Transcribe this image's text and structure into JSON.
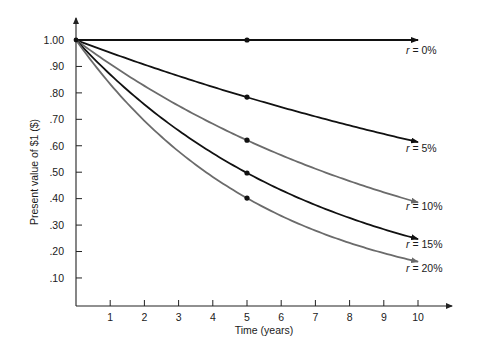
{
  "chart_data": {
    "type": "line",
    "title": "",
    "xlabel": "Time (years)",
    "ylabel": "Present value of $1 ($)",
    "xlim": [
      0,
      10
    ],
    "ylim": [
      0,
      1.0
    ],
    "x_ticks": [
      "1",
      "2",
      "3",
      "4",
      "5",
      "6",
      "7",
      "8",
      "9",
      "10"
    ],
    "y_ticks": [
      "1.00",
      ".90",
      ".80",
      ".70",
      ".60",
      ".50",
      ".40",
      ".30",
      ".20",
      ".10"
    ],
    "grid": false,
    "legend_position": "inline-right",
    "x": [
      0,
      1,
      2,
      3,
      4,
      5,
      6,
      7,
      8,
      9,
      10
    ],
    "series": [
      {
        "name": "r = 0%",
        "rate": 0.0,
        "color": "#111111",
        "values": [
          1.0,
          1.0,
          1.0,
          1.0,
          1.0,
          1.0,
          1.0,
          1.0,
          1.0,
          1.0,
          1.0
        ],
        "marker_at_5": 1.0
      },
      {
        "name": "r = 5%",
        "rate": 0.05,
        "color": "#111111",
        "values": [
          1.0,
          0.952,
          0.907,
          0.864,
          0.823,
          0.784,
          0.746,
          0.711,
          0.677,
          0.645,
          0.614
        ],
        "marker_at_5": 0.784
      },
      {
        "name": "r = 10%",
        "rate": 0.1,
        "color": "#6b6b6b",
        "values": [
          1.0,
          0.909,
          0.826,
          0.751,
          0.683,
          0.621,
          0.564,
          0.513,
          0.467,
          0.424,
          0.386
        ],
        "marker_at_5": 0.621
      },
      {
        "name": "r = 15%",
        "rate": 0.15,
        "color": "#111111",
        "values": [
          1.0,
          0.87,
          0.756,
          0.658,
          0.572,
          0.497,
          0.432,
          0.376,
          0.327,
          0.284,
          0.247
        ],
        "marker_at_5": 0.497
      },
      {
        "name": "r = 20%",
        "rate": 0.2,
        "color": "#6b6b6b",
        "values": [
          1.0,
          0.833,
          0.694,
          0.579,
          0.482,
          0.402,
          0.335,
          0.279,
          0.233,
          0.194,
          0.162
        ],
        "marker_at_5": 0.402
      }
    ]
  },
  "labels": {
    "r0": {
      "var": "r",
      "text": " = 0%"
    },
    "r5": {
      "var": "r",
      "text": " = 5%"
    },
    "r10": {
      "var": "r",
      "text": " = 10%"
    },
    "r15": {
      "var": "r",
      "text": " = 15%"
    },
    "r20": {
      "var": "r",
      "text": " = 20%"
    }
  }
}
